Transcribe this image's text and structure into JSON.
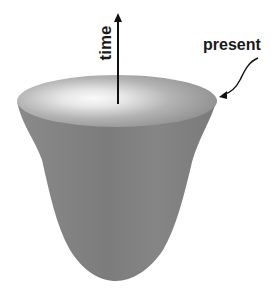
{
  "diagram": {
    "labels": {
      "time": "time",
      "present": "present"
    },
    "colors": {
      "background": "#ffffff",
      "surface_dark": "#7a7a7a",
      "surface_mid": "#8e8e8e",
      "rim_highlight": "#f2f2f2",
      "rim_inner": "#b8b8b8",
      "arrow": "#111111",
      "text": "#1a1a1a"
    },
    "elements": [
      {
        "type": "surface",
        "shape": "bowl / funnel (spacetime cone)"
      },
      {
        "type": "arrow",
        "direction": "up",
        "label": "time"
      },
      {
        "type": "curved-arrow",
        "points_to": "rim",
        "label": "present"
      }
    ]
  }
}
